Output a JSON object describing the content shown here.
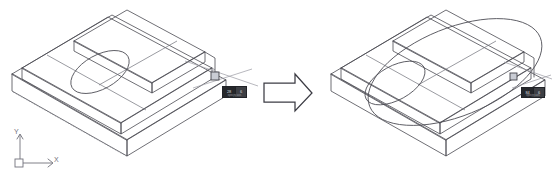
{
  "scene": {
    "title": "Ellipse scale operation on isometric stepped block",
    "background_color": "#ffffff",
    "line_color": "#4a4a52",
    "hidden_line_color": "#8d8e96",
    "grip_color": "#c9ccd4",
    "tooltip_bg": "#3d3f44",
    "tooltip_text_color": "#d8dade"
  },
  "ucs_icon": {
    "name": "ucs-axis-indicator",
    "x_label": "X",
    "y_label": "Y"
  },
  "left_figure": {
    "name": "before-state",
    "ellipse_size": "small",
    "grip": {
      "label": "grip-point"
    },
    "tooltip": {
      "field_1": "28",
      "field_2": "6",
      "hint": "Specify axis endpoint"
    }
  },
  "arrow": {
    "name": "transform-arrow",
    "direction": "right",
    "label": ""
  },
  "right_figure": {
    "name": "after-state",
    "ellipse_size": "large",
    "grip": {
      "label": "grip-point"
    },
    "tooltip": {
      "field_1": "84",
      "field_2": "6",
      "hint": "Specify axis endpoint"
    }
  }
}
